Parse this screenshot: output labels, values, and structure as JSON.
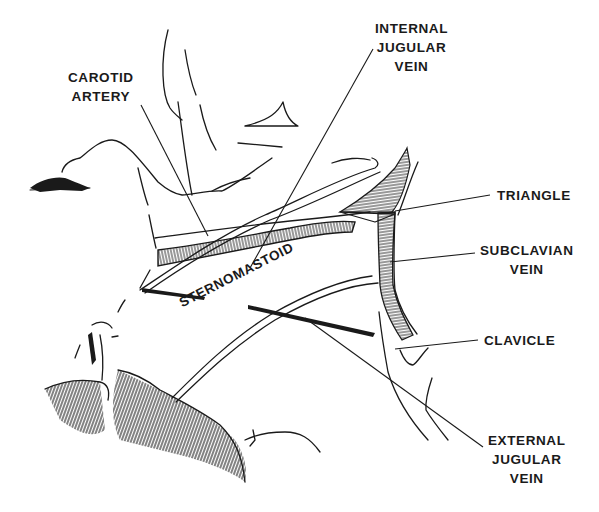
{
  "figure": {
    "type": "anatomical line drawing",
    "colors": {
      "ink": "#1a1a1a",
      "background": "#ffffff"
    }
  },
  "labels": {
    "carotid_artery": {
      "line1": "CAROTID",
      "line2": "ARTERY"
    },
    "internal_jugular_vein": {
      "line1": "INTERNAL",
      "line2": "JUGULAR",
      "line3": "VEIN"
    },
    "triangle": {
      "line1": "TRIANGLE"
    },
    "subclavian_vein": {
      "line1": "SUBCLAVIAN",
      "line2": "VEIN"
    },
    "sternomastoid": {
      "line1": "STERNOMASTOID"
    },
    "clavicle": {
      "line1": "CLAVICLE"
    },
    "external_jugular_vein": {
      "line1": "EXTERNAL",
      "line2": "JUGULAR",
      "line3": "VEIN"
    }
  }
}
